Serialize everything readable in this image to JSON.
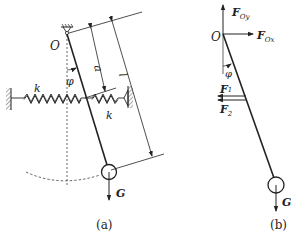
{
  "figure_a": {
    "caption": "(a)",
    "pivot_label": "O",
    "angle_label": "φ",
    "spring_left_label": "k",
    "spring_right_label": "k",
    "dim_a_label": "a",
    "dim_l_label": "l",
    "weight_label": "G"
  },
  "figure_b": {
    "caption": "(b)",
    "pivot_label": "O",
    "angle_label": "φ",
    "force_oy": {
      "main": "F",
      "sub": "Oy"
    },
    "force_ox": {
      "main": "F",
      "sub": "Ox"
    },
    "force_1": {
      "main": "F",
      "sub": "1"
    },
    "force_2": {
      "main": "F",
      "sub": "2"
    },
    "weight_label": "G"
  },
  "colors": {
    "stroke": "#222222",
    "background": "#ffffff"
  }
}
